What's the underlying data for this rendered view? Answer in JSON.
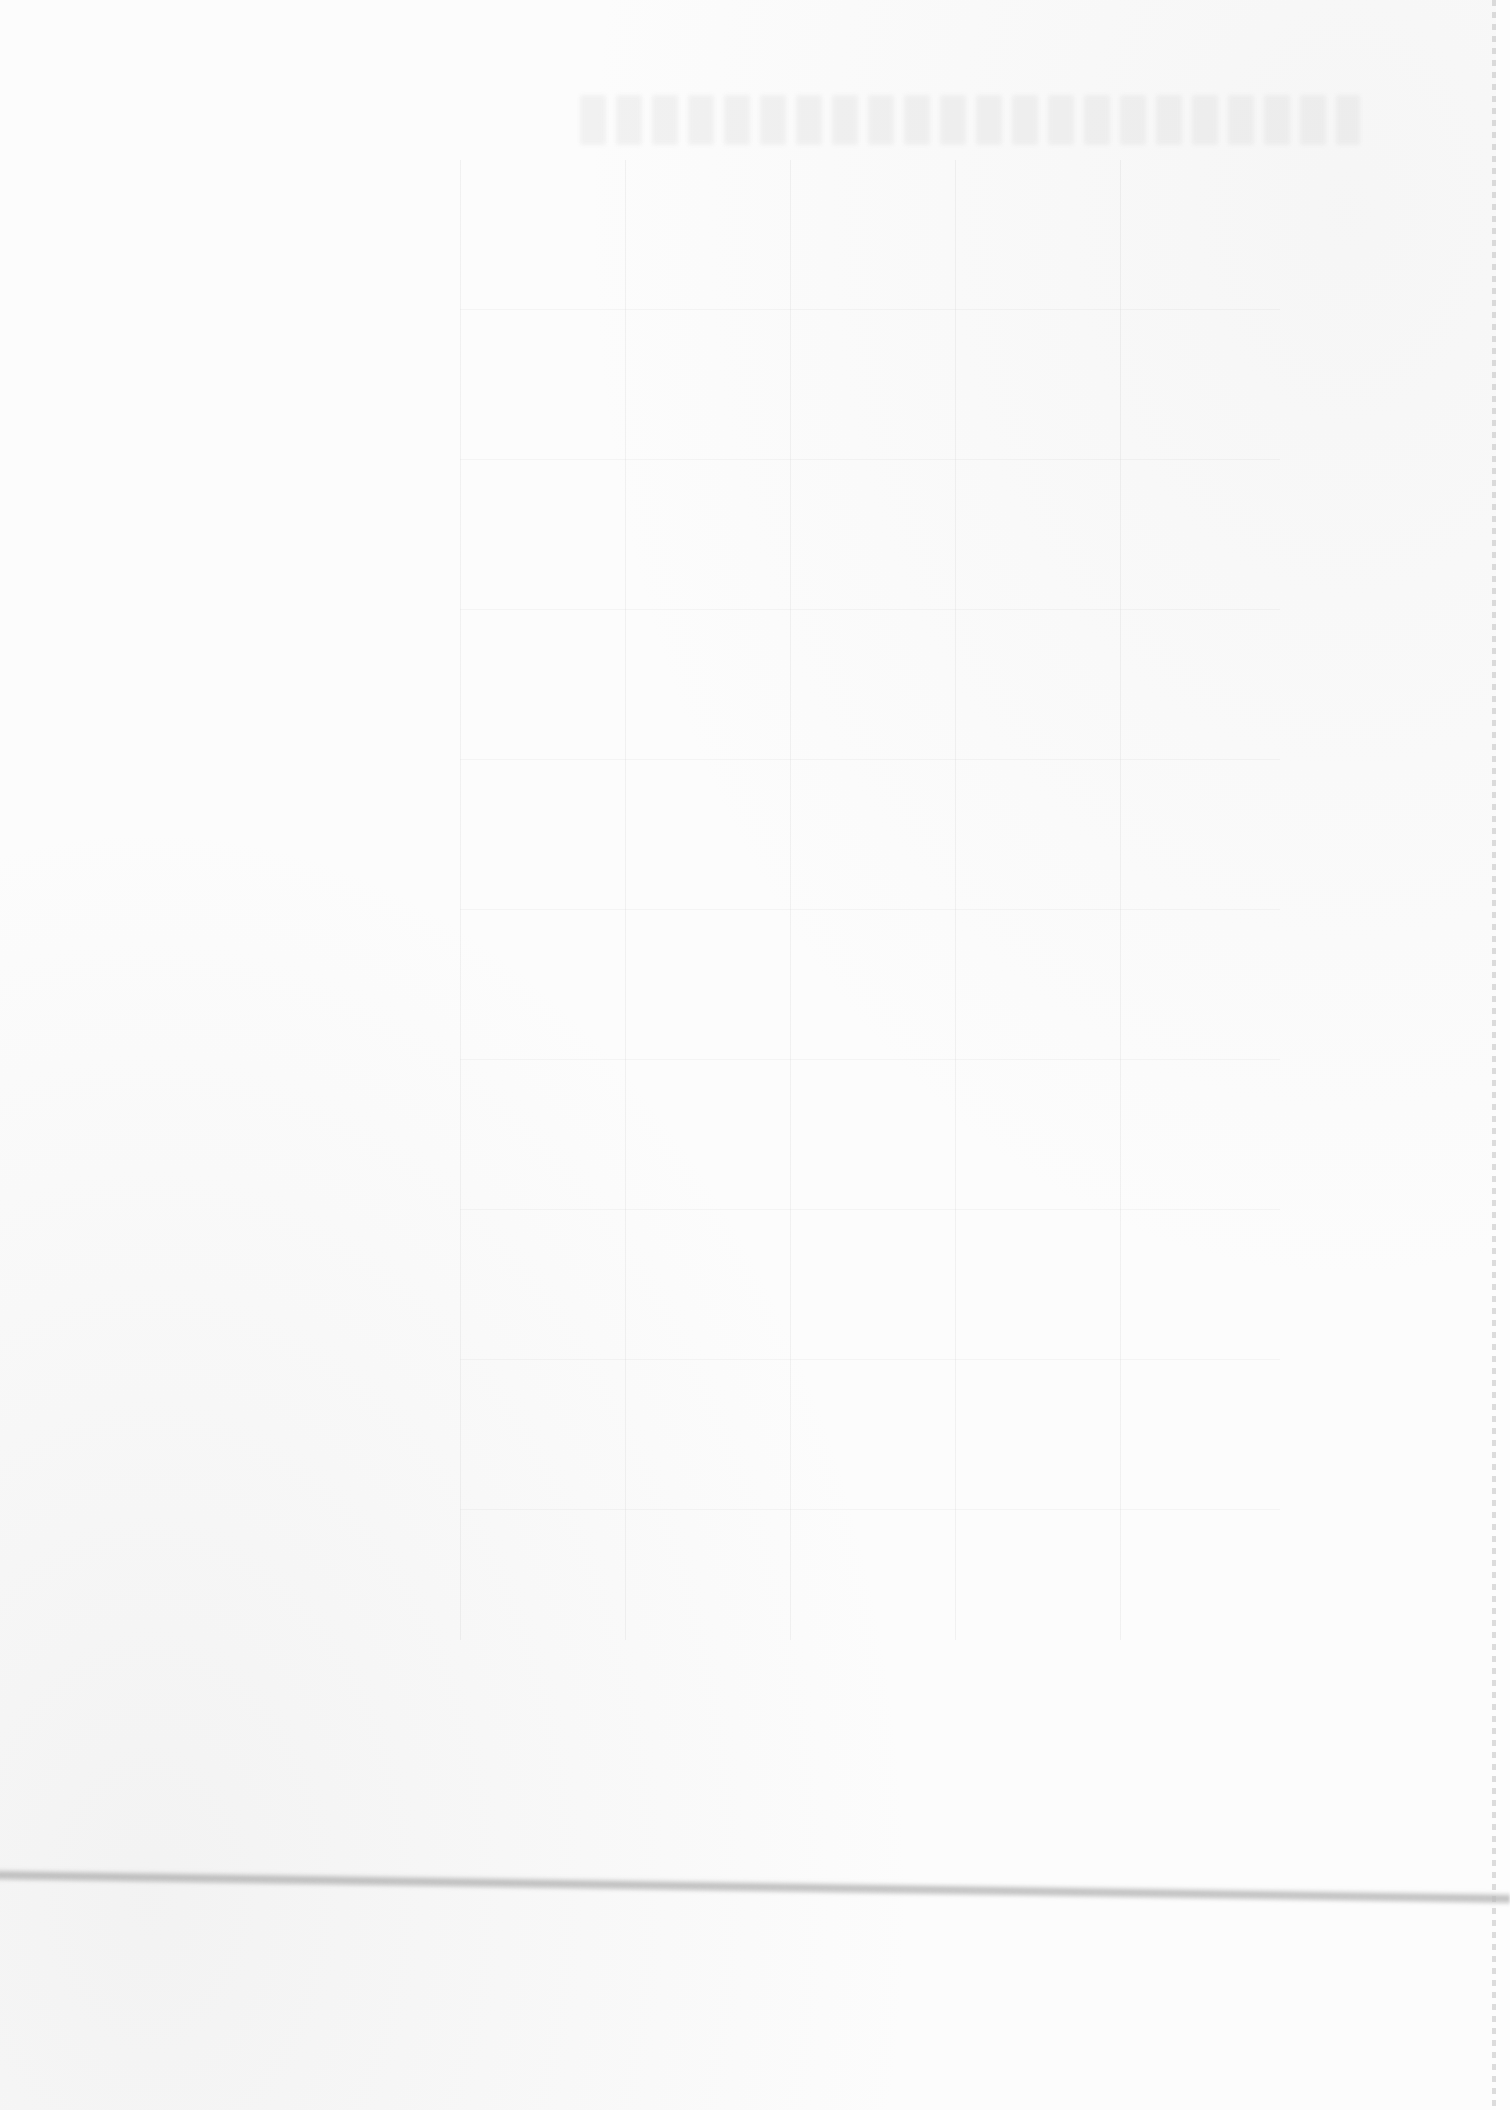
{
  "page": {
    "type": "scanned-blank-page",
    "visible_text": ""
  },
  "artifacts": {
    "bleed_through_title": "",
    "bleed_through_table": "",
    "streak": "fold-or-scanner-line"
  },
  "colors": {
    "paper": "#fcfcfc",
    "streak": "#969696",
    "bleed": "#aaaaaa"
  }
}
